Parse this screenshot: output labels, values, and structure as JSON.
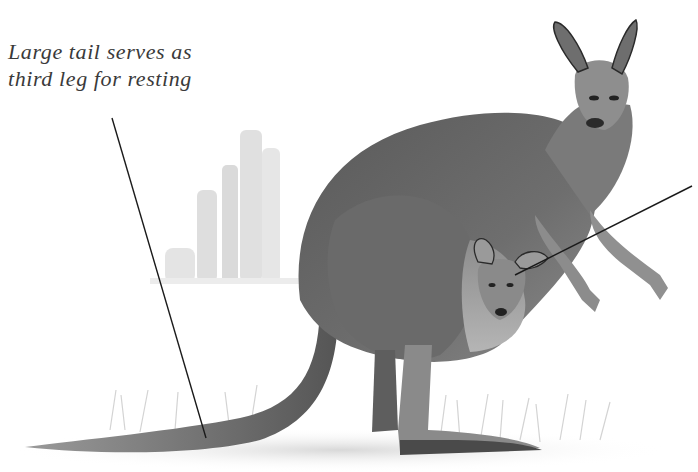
{
  "diagram": {
    "annotations": [
      {
        "id": "tail",
        "lines": [
          "Large tail serves as",
          "third leg for resting"
        ],
        "leader": {
          "from": [
            112,
            118
          ],
          "to": [
            206,
            438
          ]
        }
      },
      {
        "id": "joey",
        "lines": [
          "",
          ""
        ],
        "clipped": true,
        "leader": {
          "from": [
            692,
            186
          ],
          "to": [
            515,
            275
          ]
        }
      }
    ],
    "colors": {
      "background": "#ffffff",
      "text": "#3a3a3a",
      "leader_line": "#1a1a1a",
      "fur_dark": "#4a4a4a",
      "fur_mid": "#7a7a7a",
      "fur_light": "#bdbdbd",
      "rocks": "#d0d0d0"
    }
  }
}
